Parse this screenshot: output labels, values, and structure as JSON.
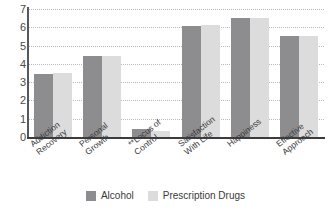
{
  "chart_data": {
    "type": "bar",
    "title": "",
    "subtitle": "",
    "xlabel": "",
    "ylabel": "",
    "ylim": [
      0,
      7
    ],
    "yticks": [
      0,
      1,
      2,
      3,
      4,
      5,
      6,
      7
    ],
    "grid": true,
    "legend_position": "bottom",
    "categories": [
      "Addiction Recovery",
      "Personal Growth",
      "**Locus of Control",
      "Satisfaction With Life",
      "Happiness",
      "Effective Approach"
    ],
    "category_lines": [
      [
        "Addiction",
        "Recovery"
      ],
      [
        "Personal",
        "Growth"
      ],
      [
        "**Locus of",
        "Control"
      ],
      [
        "Satisfaction",
        "With Life"
      ],
      [
        "Happiness"
      ],
      [
        "Effective",
        "Approach"
      ]
    ],
    "series": [
      {
        "name": "Alcohol",
        "color": "#8d8d8f",
        "values": [
          3.45,
          4.45,
          0.45,
          6.05,
          6.5,
          5.5
        ]
      },
      {
        "name": "Prescription Drugs",
        "color": "#dcdcdc",
        "values": [
          3.5,
          4.45,
          0.35,
          6.1,
          6.5,
          5.5
        ]
      }
    ]
  },
  "legend": {
    "entries": [
      {
        "label": "Alcohol",
        "color": "#8d8d8f"
      },
      {
        "label": "Prescription Drugs",
        "color": "#dcdcdc"
      }
    ]
  },
  "colors": {
    "series_alcohol": "#8d8d8f",
    "series_prescription": "#dcdcdc",
    "axis": "#3c3c3e",
    "grid": "#b9b9bb",
    "background": "#ffffff"
  }
}
